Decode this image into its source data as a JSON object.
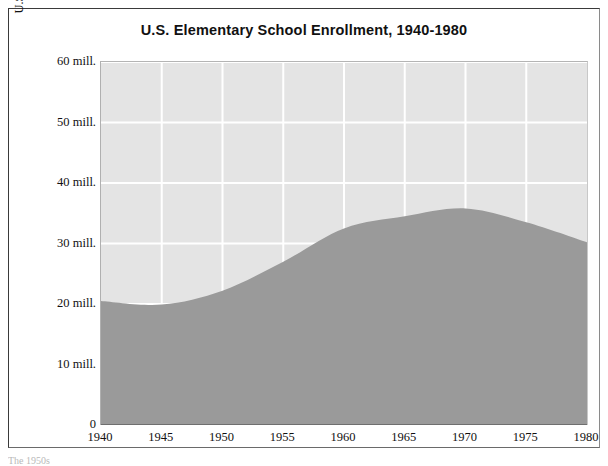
{
  "figure": {
    "title": "U.S. Elementary School Enrollment, 1940-1980",
    "y_axis_title_line1": "U.S. Elementary School Enrollment",
    "y_axis_title_line2": "Grades K-8",
    "caption_fragment": "The 1950s"
  },
  "colors": {
    "plot_background": "#e4e4e4",
    "area_fill": "#9a9a9a",
    "gridline": "#ffffff",
    "frame": "#3a3a3a",
    "text": "#111111"
  },
  "chart_data": {
    "type": "area",
    "title": "U.S. Elementary School Enrollment, 1940-1980",
    "xlabel": "",
    "ylabel": "U.S. Elementary School Enrollment Grades K-8",
    "x": [
      1940,
      1945,
      1950,
      1955,
      1960,
      1965,
      1970,
      1975,
      1980
    ],
    "values": [
      20.5,
      19.9,
      22.2,
      27.0,
      32.5,
      34.5,
      35.8,
      33.5,
      30.2
    ],
    "categories": [
      "1940",
      "1945",
      "1950",
      "1955",
      "1960",
      "1965",
      "1970",
      "1975",
      "1980"
    ],
    "xlim": [
      1940,
      1980
    ],
    "ylim": [
      0,
      60
    ],
    "xticks": [
      "1940",
      "1945",
      "1950",
      "1955",
      "1960",
      "1965",
      "1970",
      "1975",
      "1980"
    ],
    "yticks": [
      "0",
      "10 mill.",
      "20 mill.",
      "30 mill.",
      "40 mill.",
      "50 mill.",
      "60 mill."
    ],
    "ytick_values": [
      0,
      10,
      20,
      30,
      40,
      50,
      60
    ],
    "grid": true,
    "legend": "none",
    "series": [
      {
        "name": "U.S. Elementary School Enrollment Grades K-8",
        "values": [
          20.5,
          19.9,
          22.2,
          27.0,
          32.5,
          34.5,
          35.8,
          33.5,
          30.2
        ]
      }
    ]
  }
}
